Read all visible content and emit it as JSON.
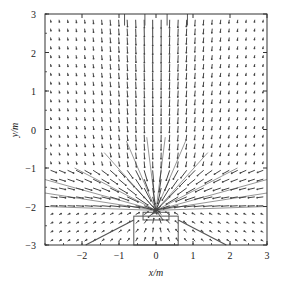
{
  "chart_data": {
    "type": "quiver",
    "title": "",
    "xlabel": "x/m",
    "ylabel": "y/m",
    "xlim": [
      -3,
      3
    ],
    "ylim": [
      -3,
      3
    ],
    "x_ticks": [
      -2,
      -1,
      0,
      1,
      2,
      3
    ],
    "x_tick_labels": [
      "−2",
      "−1",
      "0",
      "1",
      "2",
      "3"
    ],
    "y_ticks": [
      3,
      2,
      1,
      0,
      -1,
      -2,
      -3
    ],
    "y_tick_labels": [
      "3",
      "2",
      "1",
      "0",
      "−1",
      "−2",
      "−3"
    ],
    "grid": false,
    "legend": null,
    "sink_point": [
      0,
      -2.1
    ],
    "grid_spacing": [
      0.23,
      0.23
    ],
    "structures": [
      {
        "name": "central-box",
        "rect": [
          -0.35,
          -2.35,
          0.7,
          0.2
        ]
      },
      {
        "name": "outer-box",
        "rect": [
          -0.6,
          -3.0,
          1.2,
          0.75
        ]
      },
      {
        "name": "left-slope",
        "line": [
          [
            -0.6,
            -2.35
          ],
          [
            -1.9,
            -3.0
          ]
        ]
      },
      {
        "name": "right-slope",
        "line": [
          [
            0.6,
            -2.35
          ],
          [
            1.9,
            -3.0
          ]
        ]
      },
      {
        "name": "top-inlets",
        "x": [
          -0.85,
          -0.3,
          0.3,
          0.85
        ],
        "y_from": 3.0,
        "y_to": 2.7
      }
    ]
  },
  "colors": {
    "axis": "#333333",
    "vector": "#444444",
    "structure": "#555555"
  }
}
